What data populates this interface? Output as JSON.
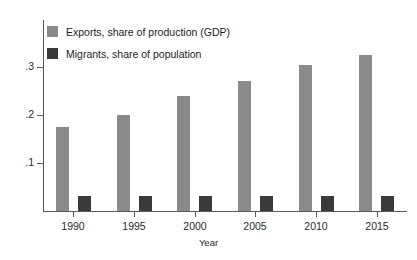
{
  "chart_data": {
    "type": "bar",
    "title": "",
    "xlabel": "Year",
    "ylabel": "",
    "categories": [
      "1990",
      "1995",
      "2000",
      "2005",
      "2010",
      "2015"
    ],
    "series": [
      {
        "name": "Exports, share of production (GDP)",
        "color": "#8a8a8a",
        "values": [
          0.175,
          0.2,
          0.24,
          0.27,
          0.305,
          0.325
        ]
      },
      {
        "name": "Migrants, share of population",
        "color": "#3a3a3a",
        "values": [
          0.031,
          0.031,
          0.031,
          0.031,
          0.031,
          0.031
        ]
      }
    ],
    "ylim": [
      0,
      0.4
    ],
    "yticks": [
      0.1,
      0.2,
      0.3
    ],
    "ytick_labels": [
      ".1",
      ".2",
      ".3"
    ],
    "grid": false,
    "legend_position": "top-left"
  },
  "legend": {
    "items": [
      {
        "label": "Exports, share of production (GDP)"
      },
      {
        "label": "Migrants, share of population"
      }
    ]
  },
  "axes": {
    "x_title": "Year"
  },
  "colors": {
    "exports": "#8a8a8a",
    "migrants": "#3a3a3a",
    "axis": "#5a5a5a",
    "text": "#1d1d1d",
    "background": "#ffffff"
  }
}
